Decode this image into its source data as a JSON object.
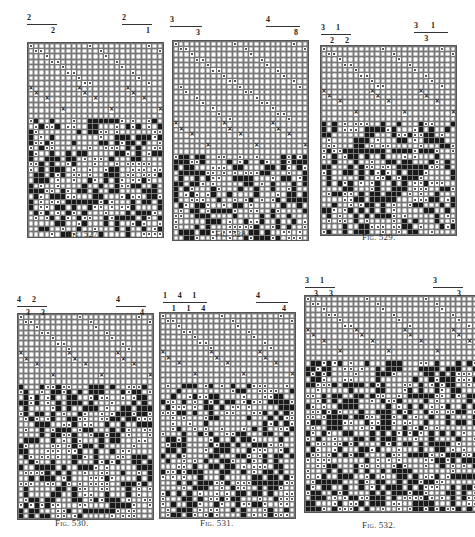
{
  "page": {
    "cell_symbols": {
      "o": "open-cell",
      "b": "filled-cell",
      "d": "dotted-cell",
      "x": "cross-cell"
    }
  },
  "figures": [
    {
      "id": "fig527",
      "caption": "Fig. 527.",
      "box": {
        "x": 27,
        "y": 42,
        "cols": 25,
        "rows": 36
      },
      "caption_pos": {
        "x": 67,
        "y": 229
      },
      "notation_groups": [
        {
          "x": 27,
          "y": 14,
          "width": 30,
          "top": [
            "2"
          ],
          "bottom": [
            "2"
          ]
        },
        {
          "x": 122,
          "y": 14,
          "width": 30,
          "top": [
            "2"
          ],
          "bottom": [
            "1"
          ]
        }
      ],
      "texture": {
        "sparse_rows": 14,
        "pattern_seed": 1
      }
    },
    {
      "id": "fig528",
      "caption": "Fig. 528.",
      "box": {
        "x": 172,
        "y": 40,
        "cols": 25,
        "rows": 37
      },
      "caption_pos": {
        "x": 215,
        "y": 229
      },
      "notation_groups": [
        {
          "x": 170,
          "y": 16,
          "width": 32,
          "top": [
            "3"
          ],
          "bottom": [
            "3"
          ]
        },
        {
          "x": 266,
          "y": 16,
          "width": 34,
          "top": [
            "4"
          ],
          "bottom": [
            "8"
          ]
        }
      ],
      "texture": {
        "sparse_rows": 21,
        "pattern_seed": 2
      }
    },
    {
      "id": "fig529",
      "caption": "Fig. 529.",
      "box": {
        "x": 320,
        "y": 45,
        "cols": 25,
        "rows": 35
      },
      "caption_pos": {
        "x": 362,
        "y": 232
      },
      "notation_groups": [
        {
          "x": 321,
          "y": 24,
          "width": 30,
          "top": [
            "3",
            "1"
          ],
          "bottom": [
            "2",
            "2"
          ]
        },
        {
          "x": 414,
          "y": 22,
          "width": 34,
          "top": [
            "3",
            "1"
          ],
          "bottom": [
            "3"
          ]
        }
      ],
      "texture": {
        "sparse_rows": 14,
        "pattern_seed": 3
      }
    },
    {
      "id": "fig530",
      "caption": "Fig. 530.",
      "box": {
        "x": 17,
        "y": 313,
        "cols": 25,
        "rows": 38
      },
      "caption_pos": {
        "x": 55,
        "y": 518
      },
      "notation_groups": [
        {
          "x": 17,
          "y": 296,
          "width": 30,
          "top": [
            "4",
            "2"
          ],
          "bottom": [
            "3",
            "3"
          ]
        },
        {
          "x": 116,
          "y": 296,
          "width": 30,
          "top": [
            "4"
          ],
          "bottom": [
            "4"
          ]
        }
      ],
      "texture": {
        "sparse_rows": 13,
        "pattern_seed": 4
      }
    },
    {
      "id": "fig531",
      "caption": "Fig. 531.",
      "box": {
        "x": 159,
        "y": 312,
        "cols": 25,
        "rows": 38
      },
      "caption_pos": {
        "x": 200,
        "y": 518
      },
      "notation_groups": [
        {
          "x": 163,
          "y": 292,
          "width": 44,
          "top": [
            "1",
            "4",
            "1"
          ],
          "bottom": [
            "1",
            "1",
            "4"
          ]
        },
        {
          "x": 256,
          "y": 292,
          "width": 32,
          "top": [
            "4"
          ],
          "bottom": [
            "4"
          ]
        }
      ],
      "texture": {
        "sparse_rows": 13,
        "pattern_seed": 5
      }
    },
    {
      "id": "fig532",
      "caption": "Fig. 532.",
      "box": {
        "x": 304,
        "y": 295,
        "cols": 32,
        "rows": 40
      },
      "caption_pos": {
        "x": 362,
        "y": 520
      },
      "notation_groups": [
        {
          "x": 305,
          "y": 277,
          "width": 30,
          "top": [
            "3",
            "1"
          ],
          "bottom": [
            "3",
            "3"
          ]
        },
        {
          "x": 433,
          "y": 277,
          "width": 30,
          "top": [
            "3"
          ],
          "bottom": [
            "3"
          ]
        }
      ],
      "texture": {
        "sparse_rows": 12,
        "pattern_seed": 6
      }
    }
  ]
}
